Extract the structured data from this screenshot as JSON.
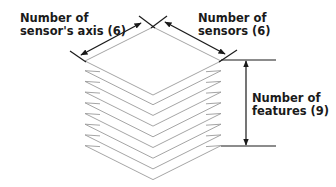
{
  "diagram": {
    "labels": {
      "axis": {
        "line1": "Number of",
        "line2": "sensor's axis (6)"
      },
      "sensors": {
        "line1": "Number of",
        "line2": "sensors (6)"
      },
      "features": {
        "line1": "Number of",
        "line2": "features (9)"
      }
    },
    "dimensions": {
      "sensor_axis": 6,
      "sensors": 6,
      "features": 9
    },
    "layer_count": 9,
    "colors": {
      "layer_stroke": "#9a9a9a",
      "dimension_stroke": "#1a1a1a",
      "text": "#1a1a1a",
      "background": "#ffffff"
    }
  }
}
